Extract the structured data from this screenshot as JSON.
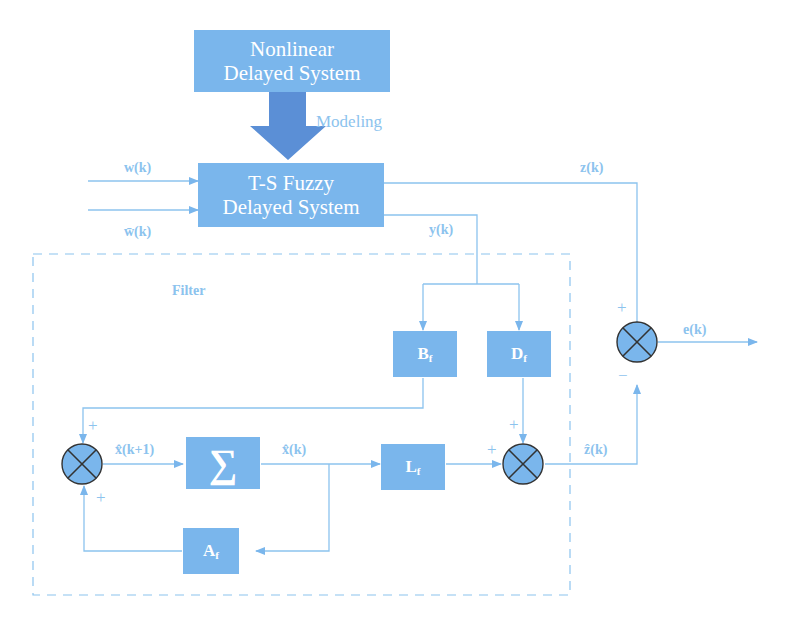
{
  "diagram": {
    "blocks": {
      "nonlinear": {
        "line1": "Nonlinear",
        "line2": "Delayed System"
      },
      "ts_fuzzy": {
        "line1": "T-S Fuzzy",
        "line2": "Delayed System"
      },
      "bf": {
        "main": "B",
        "sub": "f"
      },
      "df": {
        "main": "D",
        "sub": "f"
      },
      "sigma": {
        "symbol": "∑"
      },
      "lf": {
        "main": "L",
        "sub": "f"
      },
      "af": {
        "main": "A",
        "sub": "f"
      }
    },
    "labels": {
      "modeling": "Modeling",
      "w": "w(k)",
      "w_bar": "w̄(k)",
      "z": "z(k)",
      "y": "y(k)",
      "filter": "Filter",
      "e": "e(k)",
      "x_hat_next": "x̂(k+1)",
      "x_hat": "x̂(k)",
      "z_hat": "ẑ(k)"
    },
    "signs": {
      "sum1_top": "+",
      "sum1_bottom": "+",
      "sum2_top": "+",
      "sum2_left": "+",
      "sum3_top": "+",
      "sum3_bottom": "−"
    },
    "colors": {
      "block": "#7ab6ec",
      "arrow": "#5b8fd6",
      "line": "#8cc3ee",
      "junction": "#7ab6ec"
    }
  }
}
